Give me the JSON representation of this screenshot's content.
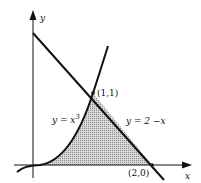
{
  "diagram": {
    "axes": {
      "x_label": "x",
      "y_label": "y"
    },
    "curves": [
      {
        "name": "cubic",
        "label_prefix": "y = x",
        "label_exp": "3"
      },
      {
        "name": "line",
        "label": "y = 2 −x"
      }
    ],
    "points": [
      {
        "name": "intersection",
        "label": "(1,1)"
      },
      {
        "name": "x-intercept",
        "label": "(2,0)"
      }
    ],
    "region": {
      "description": "shaded region bounded by y = x^3, y = 2 - x, and the x-axis",
      "fill": "#bdbdbd"
    },
    "colors": {
      "stroke": "#111111",
      "shade": "#bdbdbd",
      "background": "#ffffff"
    }
  }
}
